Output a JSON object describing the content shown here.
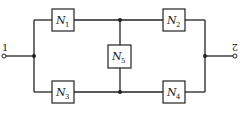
{
  "diagram": {
    "terminals": [
      {
        "id": "t1",
        "label": "1"
      },
      {
        "id": "t2",
        "label": "2"
      }
    ],
    "blocks": [
      {
        "id": "N1",
        "letter": "N",
        "sub": "1"
      },
      {
        "id": "N2",
        "letter": "N",
        "sub": "2"
      },
      {
        "id": "N3",
        "letter": "N",
        "sub": "3"
      },
      {
        "id": "N4",
        "letter": "N",
        "sub": "4"
      },
      {
        "id": "N5",
        "letter": "N",
        "sub": "5"
      }
    ],
    "colors": {
      "line": "#222222",
      "background": "#ffffff"
    }
  }
}
